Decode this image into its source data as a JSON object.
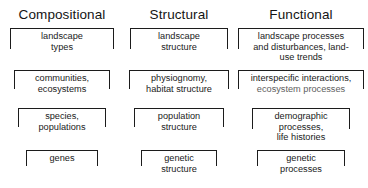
{
  "diagram": {
    "columns": [
      {
        "id": "compositional",
        "label": "Compositional"
      },
      {
        "id": "structural",
        "label": "Structural"
      },
      {
        "id": "functional",
        "label": "Functional"
      }
    ],
    "rows": [
      {
        "level": "landscape",
        "cells": [
          {
            "lines": [
              "landscape",
              "types"
            ]
          },
          {
            "lines": [
              "landscape",
              "structure"
            ]
          },
          {
            "lines": [
              "landscape processes",
              "and disturbances, land-",
              "use trends"
            ]
          }
        ]
      },
      {
        "level": "community-ecosystem",
        "cells": [
          {
            "lines": [
              "communities,",
              "ecosystems"
            ]
          },
          {
            "lines": [
              "physiognomy,",
              "habitat structure"
            ]
          },
          {
            "lines": [
              "interspecific interactions,",
              "ecosystem processes"
            ]
          }
        ]
      },
      {
        "level": "population-species",
        "cells": [
          {
            "lines": [
              "species,",
              "populations"
            ]
          },
          {
            "lines": [
              "population",
              "structure"
            ]
          },
          {
            "lines": [
              "demographic",
              "processes,",
              "life histories"
            ]
          }
        ]
      },
      {
        "level": "genetic",
        "cells": [
          {
            "lines": [
              "genes"
            ]
          },
          {
            "lines": [
              "genetic",
              "structure"
            ]
          },
          {
            "lines": [
              "genetic",
              "processes"
            ]
          }
        ]
      }
    ]
  },
  "colors": {
    "background": "#ffffff",
    "text": "#1a1a1a",
    "border": "#1c1c1c"
  }
}
